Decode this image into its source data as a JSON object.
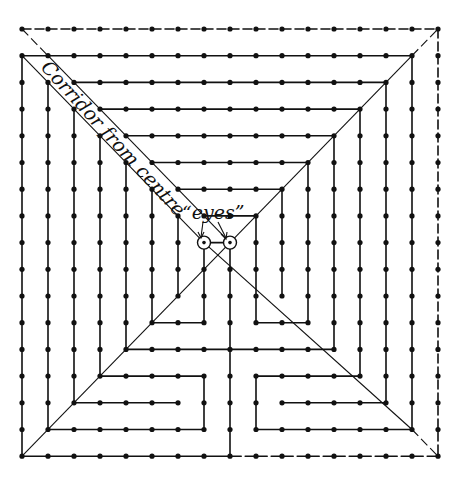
{
  "diagram": {
    "type": "labyrinth",
    "grid": {
      "cols": 17,
      "rows": 17,
      "x0": 22,
      "y0": 29,
      "dx": 26.0,
      "dy": 26.7
    },
    "colors": {
      "ink": "#111111",
      "background": "#ffffff"
    },
    "labels": {
      "corridor": "Corridor from centre",
      "eyes": "“eyes”"
    },
    "eyes": [
      [
        7,
        8
      ],
      [
        8,
        8
      ]
    ],
    "walls_solid": [
      [
        [
          0,
          1
        ],
        [
          15,
          1
        ]
      ],
      [
        [
          2,
          2
        ],
        [
          14,
          2
        ]
      ],
      [
        [
          3,
          3
        ],
        [
          13,
          3
        ]
      ],
      [
        [
          4,
          4
        ],
        [
          12,
          4
        ]
      ],
      [
        [
          5,
          5
        ],
        [
          11,
          5
        ]
      ],
      [
        [
          6,
          6
        ],
        [
          10,
          6
        ]
      ],
      [
        [
          7,
          7
        ],
        [
          9,
          7
        ]
      ],
      [
        [
          0,
          1
        ],
        [
          0,
          16
        ],
        [
          8,
          16
        ]
      ],
      [
        [
          1,
          2
        ],
        [
          1,
          15
        ],
        [
          7,
          15
        ],
        [
          7,
          13
        ],
        [
          3,
          13
        ],
        [
          3,
          4
        ]
      ],
      [
        [
          2,
          3
        ],
        [
          2,
          14
        ],
        [
          6,
          14
        ]
      ],
      [
        [
          4,
          5
        ],
        [
          4,
          12
        ],
        [
          12,
          12
        ],
        [
          12,
          4
        ]
      ],
      [
        [
          5,
          6
        ],
        [
          5,
          11
        ],
        [
          7,
          11
        ],
        [
          7,
          8
        ]
      ],
      [
        [
          6,
          7
        ],
        [
          6,
          10
        ]
      ],
      [
        [
          7,
          8
        ],
        [
          8,
          8
        ]
      ],
      [
        [
          8,
          8
        ],
        [
          8,
          16
        ]
      ],
      [
        [
          9,
          7
        ],
        [
          9,
          11
        ],
        [
          11,
          11
        ],
        [
          11,
          5
        ]
      ],
      [
        [
          10,
          6
        ],
        [
          10,
          10
        ]
      ],
      [
        [
          13,
          3
        ],
        [
          13,
          13
        ],
        [
          9,
          13
        ],
        [
          9,
          15
        ],
        [
          15,
          15
        ],
        [
          15,
          1
        ]
      ],
      [
        [
          14,
          2
        ],
        [
          14,
          14
        ],
        [
          10,
          14
        ]
      ]
    ],
    "walls_dashed": [
      [
        [
          0,
          0
        ],
        [
          16,
          0
        ],
        [
          16,
          16
        ],
        [
          8,
          16
        ]
      ]
    ],
    "diagonals_solid": [
      [
        [
          0,
          1
        ],
        [
          7,
          8
        ]
      ],
      [
        [
          1,
          1
        ],
        [
          8,
          8
        ]
      ],
      [
        [
          8,
          8
        ],
        [
          15,
          1
        ]
      ],
      [
        [
          8,
          8
        ],
        [
          0,
          16
        ]
      ],
      [
        [
          7,
          8
        ],
        [
          15,
          15
        ]
      ]
    ],
    "diagonals_dashed": [
      [
        [
          0,
          0
        ],
        [
          1,
          1
        ]
      ],
      [
        [
          15,
          1
        ],
        [
          16,
          0
        ]
      ],
      [
        [
          15,
          15
        ],
        [
          16,
          16
        ]
      ]
    ]
  }
}
